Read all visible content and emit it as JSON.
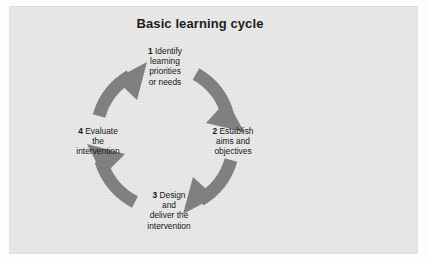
{
  "figure": {
    "title": "Basic learning cycle",
    "panel_color": "#e4e4e4",
    "arrow_color": "#808080",
    "text_color": "#161616",
    "direction": "clockwise"
  },
  "steps": [
    {
      "number": "1",
      "lines": [
        "Identify",
        "learning",
        "priorities",
        "or needs"
      ],
      "line1": "Identify",
      "line2": "learning",
      "line3": "priorities",
      "line4": "or needs",
      "position": "top"
    },
    {
      "number": "2",
      "lines": [
        "Establish",
        "aims and",
        "objectives"
      ],
      "line1": "Establish",
      "line2": "aims and",
      "line3": "objectives",
      "position": "right"
    },
    {
      "number": "3",
      "lines": [
        "Design",
        "and",
        "deliver the",
        "intervention"
      ],
      "line1": "Design",
      "line2": "and",
      "line3": "deliver the",
      "line4": "intervention",
      "position": "bottom"
    },
    {
      "number": "4",
      "lines": [
        "Evaluate",
        "the",
        "intervention"
      ],
      "line1": "Evaluate",
      "line2": "the",
      "line3": "intervention",
      "position": "left"
    }
  ],
  "arrows": [
    {
      "name": "arrow-step1-to-step2",
      "from": "1",
      "to": "2",
      "quadrant": "top-right"
    },
    {
      "name": "arrow-step2-to-step3",
      "from": "2",
      "to": "3",
      "quadrant": "bottom-right"
    },
    {
      "name": "arrow-step3-to-step4",
      "from": "3",
      "to": "4",
      "quadrant": "bottom-left"
    },
    {
      "name": "arrow-step4-to-step1",
      "from": "4",
      "to": "1",
      "quadrant": "top-left"
    }
  ]
}
